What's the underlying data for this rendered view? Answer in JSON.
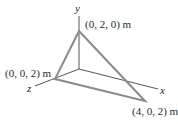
{
  "diagram": {
    "type": "3d-coordinate-triangle",
    "axes": {
      "x_label": "x",
      "y_label": "y",
      "z_label": "z"
    },
    "vertices": [
      {
        "id": "A",
        "coords": "(0, 2, 0) m"
      },
      {
        "id": "B",
        "coords": "(0, 0, 2) m"
      },
      {
        "id": "C",
        "coords": "(4, 0, 2) m"
      }
    ],
    "colors": {
      "axis": "#555555",
      "triangle_edge": "#8a8a8a",
      "text": "#2a2a2a",
      "background": "#ffffff"
    }
  }
}
